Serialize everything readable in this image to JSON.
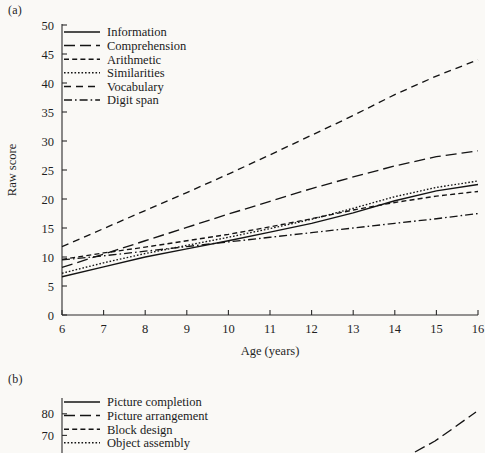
{
  "figure": {
    "panel_a_label": "(a)",
    "panel_b_label": "(b)",
    "background_color": "#faf9f6",
    "ink_color": "#141414"
  },
  "chart_data": [
    {
      "type": "line",
      "panel": "(a)",
      "title": "",
      "xlabel": "Age (years)",
      "ylabel": "Raw score",
      "x": [
        6,
        7,
        8,
        9,
        10,
        11,
        12,
        13,
        14,
        15,
        16
      ],
      "xlim": [
        6,
        16
      ],
      "ylim": [
        0,
        50
      ],
      "xticks": [
        6,
        7,
        8,
        9,
        10,
        11,
        12,
        13,
        14,
        15,
        16
      ],
      "yticks": [
        0,
        5,
        10,
        15,
        20,
        25,
        30,
        35,
        40,
        45,
        50
      ],
      "xticklabels": [
        "6",
        "7",
        "8",
        "9",
        "10",
        "11",
        "12",
        "13",
        "14",
        "15",
        "16"
      ],
      "yticklabels": [
        "0",
        "5",
        "10",
        "15",
        "20",
        "25",
        "30",
        "35",
        "40",
        "45",
        "50"
      ],
      "grid": false,
      "legend_position": "upper left",
      "series": [
        {
          "name": "Information",
          "dash": "none",
          "values": [
            6.6,
            8.3,
            10.0,
            11.4,
            12.8,
            14.3,
            15.8,
            17.6,
            19.7,
            21.4,
            22.5
          ]
        },
        {
          "name": "Comprehension",
          "dash": "long",
          "values": [
            8.2,
            10.5,
            12.8,
            15.1,
            17.4,
            19.6,
            21.8,
            23.8,
            25.7,
            27.3,
            28.3
          ]
        },
        {
          "name": "Arithmetic",
          "dash": "medium",
          "values": [
            9.6,
            10.7,
            11.7,
            12.8,
            13.9,
            15.2,
            16.6,
            18.1,
            19.4,
            20.5,
            21.3
          ]
        },
        {
          "name": "Similarities",
          "dash": "dotted",
          "values": [
            7.2,
            9.0,
            10.6,
            12.0,
            13.4,
            14.9,
            16.5,
            18.4,
            20.4,
            22.0,
            23.1
          ]
        },
        {
          "name": "Vocabulary",
          "dash": "dashdash",
          "values": [
            11.8,
            14.9,
            18.0,
            21.1,
            24.3,
            27.6,
            31.0,
            34.4,
            38.0,
            41.2,
            44.0
          ]
        },
        {
          "name": "Digit span",
          "dash": "dashdot",
          "values": [
            9.5,
            10.2,
            11.0,
            11.8,
            12.6,
            13.4,
            14.2,
            15.0,
            15.8,
            16.6,
            17.5
          ]
        }
      ]
    },
    {
      "type": "line",
      "panel": "(b)",
      "title": "",
      "xlabel": "",
      "ylabel": "",
      "note": "Panel (b) is cropped by the bottom edge of the screenshot; only the top of the axis, its legend and the upper portion of one rising curve are visible.",
      "ylim": [
        60,
        85
      ],
      "yticks": [
        70,
        80
      ],
      "yticklabels": [
        "70",
        "80"
      ],
      "grid": false,
      "legend_position": "upper left",
      "series": [
        {
          "name": "Picture completion",
          "dash": "none",
          "values": []
        },
        {
          "name": "Picture arrangement",
          "dash": "long",
          "values": []
        },
        {
          "name": "Block design",
          "dash": "medium",
          "values": []
        },
        {
          "name": "Object assembly",
          "dash": "dotted",
          "values": []
        }
      ],
      "visible_curve": {
        "name": "Picture arrangement",
        "dash": "long",
        "points": [
          [
            415,
            452
          ],
          [
            435,
            441
          ],
          [
            455,
            427
          ],
          [
            476,
            412
          ]
        ]
      }
    }
  ]
}
